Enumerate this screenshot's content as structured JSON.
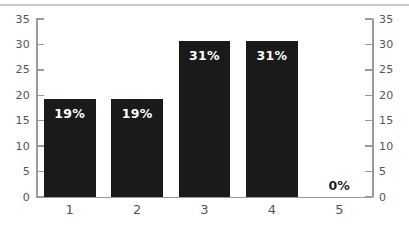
{
  "chart_data": {
    "type": "bar",
    "title": "",
    "subtitle": "",
    "xlabel": "",
    "ylabel": "",
    "categories": [
      "1",
      "2",
      "3",
      "4",
      "5"
    ],
    "values": [
      19.2,
      19.3,
      30.7,
      30.7,
      0
    ],
    "data_labels": [
      "19%",
      "19%",
      "31%",
      "31%",
      "0%"
    ],
    "series": [
      {
        "name": "",
        "values": [
          19.2,
          19.3,
          30.7,
          30.7,
          0
        ]
      }
    ],
    "ylim": [
      0,
      35
    ],
    "yticks": [
      0,
      5,
      10,
      15,
      20,
      25,
      30,
      35
    ],
    "ytick_labels_left": [
      "0",
      "5",
      "10",
      "15",
      "20",
      "25",
      "30",
      "35"
    ],
    "ytick_labels_right": [
      "0",
      "5",
      "10",
      "15",
      "20",
      "25",
      "30",
      "35"
    ],
    "right_axis": true,
    "grid": false,
    "legend": null,
    "legend_position": "none",
    "bar_color": "#1a1a1a",
    "label_color_inside": "#ffffff",
    "label_color_outside": "#1f1f1f",
    "axis_color": "#9a9a9a",
    "tick_text_color": "#555555",
    "background_color": "#ffffff",
    "top_rule_color": "#c9c9c9"
  },
  "axes": {
    "left_ticks": [
      {
        "label": "35",
        "value": 35
      },
      {
        "label": "30",
        "value": 30
      },
      {
        "label": "25",
        "value": 25
      },
      {
        "label": "20",
        "value": 20
      },
      {
        "label": "15",
        "value": 15
      },
      {
        "label": "10",
        "value": 10
      },
      {
        "label": "5",
        "value": 5
      },
      {
        "label": "0",
        "value": 0
      }
    ],
    "right_ticks": [
      {
        "label": "35",
        "value": 35
      },
      {
        "label": "30",
        "value": 30
      },
      {
        "label": "25",
        "value": 25
      },
      {
        "label": "20",
        "value": 20
      },
      {
        "label": "15",
        "value": 15
      },
      {
        "label": "10",
        "value": 10
      },
      {
        "label": "5",
        "value": 5
      },
      {
        "label": "0",
        "value": 0
      }
    ]
  },
  "bars": [
    {
      "category": "1",
      "value": 19.2,
      "label": "19%",
      "label_inside": true
    },
    {
      "category": "2",
      "value": 19.3,
      "label": "19%",
      "label_inside": true
    },
    {
      "category": "3",
      "value": 30.7,
      "label": "31%",
      "label_inside": true
    },
    {
      "category": "4",
      "value": 30.7,
      "label": "31%",
      "label_inside": true
    },
    {
      "category": "5",
      "value": 0,
      "label": "0%",
      "label_inside": false
    }
  ]
}
